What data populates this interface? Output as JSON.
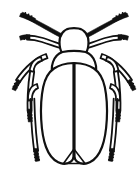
{
  "figure": {
    "style": "black-and-white line drawing",
    "orientation": "dorsal (top-down)",
    "background_color": "#ffffff",
    "ink_color": "#111111",
    "width_px": 139,
    "height_px": 174,
    "caption": ""
  },
  "anatomy": {
    "head": {
      "label": "head",
      "shape": "oval dome",
      "position": "top center"
    },
    "pronotum": {
      "label": "pronotum",
      "shape": "rounded trapezoid",
      "position": "below head"
    },
    "elytra": {
      "label": "elytra",
      "count": 2,
      "shape": "two elongated wing covers meeting at midline seam",
      "tip": "converging rounded apex with small triangular notch"
    },
    "antennae": {
      "label": "antennae",
      "count": 2,
      "description": "long segmented filiform antennae angling up and outward with thick dark segmented tips"
    },
    "palps": {
      "label": "maxillary palps",
      "count": 2,
      "description": "short segmented appendages below the antennae pointing outward"
    },
    "legs": {
      "label": "legs",
      "pairs": 3,
      "parts": [
        "femur",
        "tibia",
        "tarsus"
      ],
      "description": "three pairs of legs, each with thick femur, slender tibia and dark segmented tarsus"
    }
  },
  "colors": {
    "ink": "#111111",
    "fill": "#ffffff"
  }
}
